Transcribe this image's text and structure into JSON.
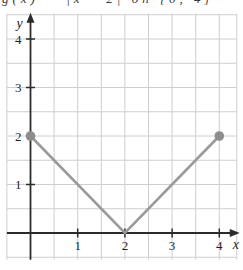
{
  "caption": {
    "text": "g(x) = |x - 2| on [0, 4]"
  },
  "colors": {
    "background": "#ffffff",
    "grid": "#cbced3",
    "axis": "#2b2b2b",
    "tick_label": "#1f1f1f",
    "line": "#9a9a9a",
    "marker": "#8d8d8d"
  },
  "chart_data": {
    "type": "line",
    "title": "",
    "xlabel": "x",
    "ylabel": "y",
    "xlim": [
      -0.5,
      4.37
    ],
    "ylim": [
      -0.55,
      4.52
    ],
    "x_ticks": [
      1,
      2,
      3,
      4
    ],
    "y_ticks": [
      1,
      2,
      3,
      4
    ],
    "grid": true,
    "grid_step": 0.5,
    "legend": false,
    "series": [
      {
        "name": "v-shaped-absolute-value-segment",
        "x": [
          0,
          2,
          4
        ],
        "y": [
          2,
          0,
          2
        ],
        "color": "#9a9a9a",
        "marker": "filled-circle",
        "marker_color": "#8d8d8d",
        "marker_points": [
          [
            0,
            2
          ],
          [
            4,
            2
          ]
        ]
      }
    ]
  }
}
